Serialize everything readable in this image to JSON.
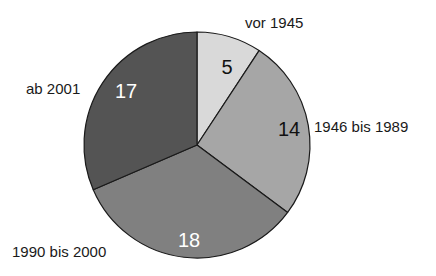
{
  "chart_data": {
    "type": "pie",
    "title": "",
    "title_cropped": true,
    "categories": [
      "vor 1945",
      "1946 bis 1989",
      "1990 bis 2000",
      "ab 2001"
    ],
    "values": [
      5,
      14,
      18,
      17
    ],
    "total": 54,
    "start_angle_deg": 0,
    "direction": "clockwise",
    "colors": [
      "#d9d9d9",
      "#a6a6a6",
      "#808080",
      "#545454"
    ],
    "value_label_colors": [
      "#111111",
      "#111111",
      "#ffffff",
      "#ffffff"
    ],
    "legend": "none",
    "label_position": "outside"
  },
  "labels": {
    "slice_0": "vor 1945",
    "slice_1": "1946 bis 1989",
    "slice_2": "1990 bis 2000",
    "slice_3": "ab 2001"
  },
  "values_text": {
    "slice_0": "5",
    "slice_1": "14",
    "slice_2": "18",
    "slice_3": "17"
  }
}
